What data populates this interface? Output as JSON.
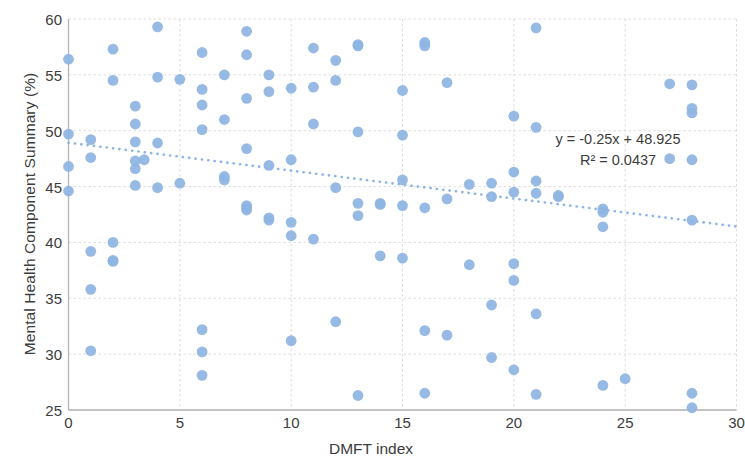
{
  "chart_data": {
    "type": "scatter",
    "title": "",
    "xlabel": "DMFT index",
    "ylabel": "Mental Health Component Summary (%)",
    "xlim": [
      0,
      30
    ],
    "ylim": [
      25,
      60
    ],
    "xticks": [
      0,
      5,
      10,
      15,
      20,
      25,
      30
    ],
    "yticks": [
      25,
      30,
      35,
      40,
      45,
      50,
      55,
      60
    ],
    "grid": true,
    "legend": null,
    "marker_color": "#8eb4e3",
    "trendline": {
      "type": "linear-dotted",
      "color": "#8eb4e3",
      "slope": -0.25,
      "intercept": 48.925,
      "x_start": 0,
      "x_end": 30,
      "equation_label": "y = -0.25x + 48.925",
      "r2_label": "R² = 0.0437",
      "r2_value": 0.0437
    },
    "points": [
      [
        0,
        56.4
      ],
      [
        0,
        49.7
      ],
      [
        0,
        46.8
      ],
      [
        0,
        44.6
      ],
      [
        1,
        49.2
      ],
      [
        1,
        47.6
      ],
      [
        1,
        39.2
      ],
      [
        1,
        35.8
      ],
      [
        1,
        30.3
      ],
      [
        2,
        57.3
      ],
      [
        2,
        54.5
      ],
      [
        2,
        40.0
      ],
      [
        2,
        38.3
      ],
      [
        2,
        38.4
      ],
      [
        3,
        52.2
      ],
      [
        3,
        50.6
      ],
      [
        3,
        49.0
      ],
      [
        3,
        47.3
      ],
      [
        3,
        46.6
      ],
      [
        3,
        45.1
      ],
      [
        3.4,
        47.4
      ],
      [
        4,
        59.3
      ],
      [
        4,
        54.8
      ],
      [
        4,
        48.9
      ],
      [
        4,
        44.9
      ],
      [
        5,
        54.6
      ],
      [
        5,
        45.3
      ],
      [
        6,
        57.0
      ],
      [
        6,
        53.7
      ],
      [
        6,
        52.3
      ],
      [
        6,
        50.1
      ],
      [
        6,
        32.2
      ],
      [
        6,
        30.2
      ],
      [
        6,
        28.1
      ],
      [
        7,
        55.0
      ],
      [
        7,
        51.0
      ],
      [
        7,
        45.9
      ],
      [
        7,
        45.6
      ],
      [
        8,
        58.9
      ],
      [
        8,
        56.8
      ],
      [
        8,
        52.9
      ],
      [
        8,
        48.4
      ],
      [
        8,
        43.3
      ],
      [
        8,
        43.1
      ],
      [
        8,
        42.9
      ],
      [
        9,
        55.0
      ],
      [
        9,
        53.5
      ],
      [
        9,
        46.9
      ],
      [
        9,
        42.2
      ],
      [
        9,
        42.0
      ],
      [
        10,
        53.8
      ],
      [
        10,
        47.4
      ],
      [
        10,
        41.8
      ],
      [
        10,
        40.6
      ],
      [
        10,
        31.2
      ],
      [
        11,
        57.4
      ],
      [
        11,
        53.9
      ],
      [
        11,
        50.6
      ],
      [
        11,
        40.3
      ],
      [
        12,
        56.3
      ],
      [
        12,
        54.5
      ],
      [
        12,
        44.9
      ],
      [
        12,
        32.9
      ],
      [
        13,
        57.7
      ],
      [
        13,
        57.6
      ],
      [
        13,
        49.9
      ],
      [
        13,
        43.5
      ],
      [
        13,
        42.4
      ],
      [
        13,
        26.3
      ],
      [
        14,
        38.8
      ],
      [
        14,
        43.5
      ],
      [
        14,
        43.4
      ],
      [
        15,
        53.6
      ],
      [
        15,
        49.6
      ],
      [
        15,
        45.6
      ],
      [
        15,
        43.3
      ],
      [
        15,
        38.6
      ],
      [
        16,
        57.9
      ],
      [
        16,
        57.6
      ],
      [
        16,
        43.1
      ],
      [
        16,
        32.1
      ],
      [
        16,
        26.5
      ],
      [
        17,
        54.3
      ],
      [
        17,
        43.9
      ],
      [
        17,
        31.7
      ],
      [
        18,
        45.2
      ],
      [
        18,
        38.0
      ],
      [
        19,
        45.3
      ],
      [
        19,
        44.1
      ],
      [
        19,
        34.4
      ],
      [
        19,
        29.7
      ],
      [
        20,
        51.3
      ],
      [
        20,
        46.3
      ],
      [
        20,
        44.5
      ],
      [
        20,
        38.1
      ],
      [
        20,
        36.6
      ],
      [
        20,
        28.6
      ],
      [
        21,
        59.2
      ],
      [
        21,
        50.3
      ],
      [
        21,
        45.5
      ],
      [
        21,
        44.4
      ],
      [
        21,
        33.6
      ],
      [
        21,
        26.4
      ],
      [
        22,
        44.2
      ],
      [
        22,
        44.1
      ],
      [
        24,
        43.0
      ],
      [
        24,
        42.7
      ],
      [
        24,
        41.4
      ],
      [
        24,
        27.2
      ],
      [
        25,
        27.8
      ],
      [
        27,
        54.2
      ],
      [
        27,
        47.5
      ],
      [
        28,
        54.1
      ],
      [
        28,
        52.0
      ],
      [
        28,
        51.6
      ],
      [
        28,
        47.4
      ],
      [
        28,
        42.0
      ],
      [
        28,
        26.5
      ],
      [
        28,
        25.2
      ]
    ]
  },
  "equation": {
    "line1": "y = -0.25x + 48.925",
    "line2": "R² = 0.0437"
  },
  "axes": {
    "y_title": "Mental Health Component Summary (%)",
    "x_title": "DMFT index",
    "y_tick_labels": [
      "60",
      "55",
      "50",
      "45",
      "40",
      "35",
      "30",
      "25"
    ],
    "x_tick_labels": [
      "0",
      "5",
      "10",
      "15",
      "20",
      "25",
      "30"
    ]
  }
}
